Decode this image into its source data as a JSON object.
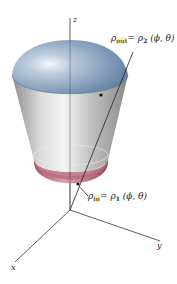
{
  "diagram": {
    "type": "3d-solid-between-spherical-surfaces",
    "axes": {
      "z_label": "z",
      "y_label": "y",
      "x_label": "x"
    },
    "labels": {
      "outer": {
        "rho": "ρ",
        "subscript": "out",
        "equals": "=",
        "rhs_rho": "ρ",
        "rhs_sub": "2",
        "args": "(ϕ, θ)"
      },
      "inner": {
        "rho": "ρ",
        "subscript": "in",
        "equals": "=",
        "rhs_rho": "ρ",
        "rhs_sub": "1",
        "args": "(ϕ, θ)"
      }
    },
    "colors": {
      "outer_cap": "#8fa8c4",
      "side_surface": "#c8c8c8",
      "inner_bottom": "#b56a78",
      "axis": "#333333"
    }
  }
}
